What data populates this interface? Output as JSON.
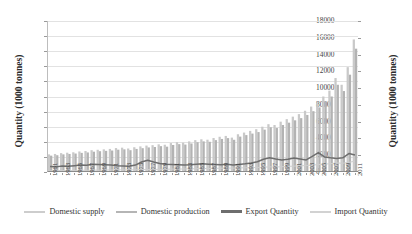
{
  "chart_data": {
    "type": "bar",
    "title": "",
    "xlabel": "",
    "ylabel": "Quantity (1000 tonnes)",
    "ylabel_right": "Quantity (1000 tonnes)",
    "ylim": [
      0,
      5000
    ],
    "ylim_right": [
      0,
      18000
    ],
    "ytick_step": 500,
    "ytick_step_right": 2000,
    "yticks_left": [
      "0",
      "500",
      "1000",
      "1500",
      "2000",
      "2500",
      "3000",
      "3500",
      "4000",
      "4500",
      "5000"
    ],
    "yticks_right": [
      "0",
      "2000",
      "4000",
      "6000",
      "8000",
      "10000",
      "12000",
      "14000",
      "16000",
      "18000"
    ],
    "grid": true,
    "legend_position": "bottom",
    "x": [
      1961,
      1962,
      1963,
      1964,
      1965,
      1966,
      1967,
      1968,
      1969,
      1970,
      1971,
      1972,
      1973,
      1974,
      1975,
      1976,
      1977,
      1978,
      1979,
      1980,
      1981,
      1982,
      1983,
      1984,
      1985,
      1986,
      1987,
      1988,
      1989,
      1990,
      1991,
      1992,
      1993,
      1994,
      1995,
      1996,
      1997,
      1998,
      1999,
      2000,
      2001,
      2002,
      2003,
      2004,
      2005,
      2006,
      2007,
      2008,
      2009,
      2010,
      2011
    ],
    "xtick_labels": [
      "1961",
      "1963",
      "1965",
      "1967",
      "1969",
      "1971",
      "1973",
      "1975",
      "1977",
      "1979",
      "1981",
      "1983",
      "1985",
      "1987",
      "1989",
      "1991",
      "1993",
      "1995",
      "1997",
      "1999",
      "2001",
      "2003",
      "2005",
      "2007",
      "2009",
      "2011"
    ],
    "series": [
      {
        "name": "Domestic supply",
        "kind": "bar",
        "axis": "right",
        "color": "#c9c9c9",
        "values": [
          2100,
          2150,
          2250,
          2300,
          2350,
          2450,
          2500,
          2600,
          2650,
          2700,
          2750,
          2850,
          2900,
          2800,
          2950,
          3050,
          3150,
          3200,
          3300,
          3250,
          3450,
          3550,
          3500,
          3650,
          3800,
          3900,
          3850,
          4050,
          4200,
          4300,
          4100,
          4500,
          4700,
          4900,
          5100,
          5400,
          5700,
          5600,
          6000,
          6300,
          6600,
          6900,
          7300,
          7800,
          8300,
          9000,
          9700,
          11200,
          10400,
          12500,
          15800
        ]
      },
      {
        "name": "Domestic production",
        "kind": "bar",
        "axis": "right",
        "color": "#b3b3b3",
        "values": [
          1950,
          2000,
          2100,
          2150,
          2200,
          2280,
          2330,
          2420,
          2480,
          2520,
          2560,
          2660,
          2700,
          2600,
          2750,
          2840,
          2930,
          2980,
          3080,
          3020,
          3220,
          3320,
          3270,
          3400,
          3550,
          3650,
          3600,
          3800,
          3940,
          4040,
          3840,
          4220,
          4400,
          4580,
          4760,
          5050,
          5330,
          5240,
          5600,
          5880,
          6160,
          6420,
          6800,
          7250,
          7700,
          8350,
          9000,
          10400,
          9650,
          11600,
          14700
        ]
      },
      {
        "name": "Export Quantity",
        "kind": "line",
        "axis": "left",
        "color": "#6e6e6e",
        "values": [
          180,
          170,
          200,
          190,
          210,
          230,
          220,
          260,
          250,
          240,
          230,
          210,
          200,
          190,
          230,
          330,
          390,
          330,
          280,
          260,
          250,
          240,
          230,
          240,
          260,
          270,
          260,
          250,
          240,
          260,
          230,
          250,
          270,
          300,
          340,
          420,
          470,
          430,
          400,
          420,
          460,
          430,
          400,
          520,
          640,
          500,
          470,
          450,
          470,
          610,
          560
        ]
      },
      {
        "name": "Import Quantity",
        "kind": "line",
        "axis": "left",
        "color": "#cfcfcf",
        "values": [
          40,
          45,
          50,
          48,
          52,
          55,
          58,
          60,
          62,
          65,
          68,
          70,
          72,
          70,
          75,
          80,
          82,
          85,
          88,
          90,
          95,
          98,
          100,
          105,
          110,
          115,
          118,
          120,
          125,
          130,
          128,
          135,
          140,
          145,
          150,
          160,
          170,
          165,
          175,
          185,
          195,
          205,
          215,
          230,
          245,
          260,
          275,
          300,
          290,
          320,
          360
        ]
      }
    ]
  },
  "legend": {
    "items": [
      {
        "label": "Domestic supply",
        "color": "#cdcdcd",
        "width": 2.2
      },
      {
        "label": "Domestic production",
        "color": "#b5b5b5",
        "width": 2.6
      },
      {
        "label": "Export Quantity",
        "color": "#6e6e6e",
        "width": 3.2
      },
      {
        "label": "Import Quantity",
        "color": "#d2d2d2",
        "width": 2.0
      }
    ]
  }
}
